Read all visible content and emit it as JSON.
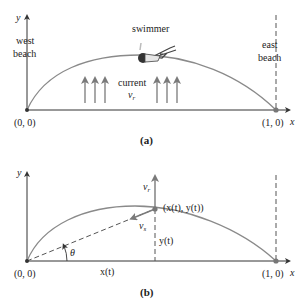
{
  "colors": {
    "curve": "#8a8a8a",
    "axis": "#333333",
    "arrow": "#7a7a7a",
    "text": "#222222",
    "point": "#777777"
  },
  "panel_a": {
    "y_axis_label": "y",
    "x_axis_label": "x",
    "west_beach_line1": "west",
    "west_beach_line2": "beach",
    "east_beach_line1": "east",
    "east_beach_line2": "beach",
    "swimmer_label": "swimmer",
    "current_label": "current",
    "current_symbol": "v",
    "current_subscript": "r",
    "origin_label": "(0, 0)",
    "end_label": "(1, 0)",
    "caption": "(a)",
    "swimmer_icon": "swimmer-figure"
  },
  "panel_b": {
    "y_axis_label": "y",
    "x_axis_label": "x",
    "vr_symbol": "v",
    "vr_subscript": "r",
    "vs_symbol": "v",
    "vs_subscript": "s",
    "point_label": "(x(t), y(t))",
    "yt_label": "y(t)",
    "xt_label": "x(t)",
    "theta_label": "θ",
    "origin_label": "(0, 0)",
    "end_label": "(1, 0)",
    "caption": "(b)"
  }
}
